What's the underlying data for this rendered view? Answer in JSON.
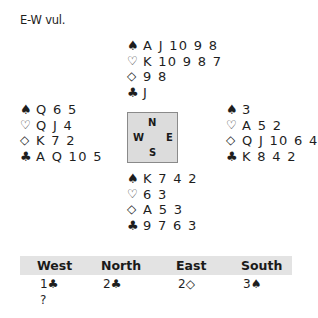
{
  "vulnerability": "E-W vul.",
  "icons": {
    "spade": "♠",
    "heart": "♡",
    "diamond": "◇",
    "club": "♣"
  },
  "hands": {
    "north": {
      "spades": "A J 10 9 8",
      "hearts": "K 10 9 8 7",
      "diamonds": "9 8",
      "clubs": "J"
    },
    "west": {
      "spades": "Q 6 5",
      "hearts": "Q J 4",
      "diamonds": "K 7 2",
      "clubs": "A Q 10 5"
    },
    "east": {
      "spades": "3",
      "hearts": "A 5 2",
      "diamonds": "Q J 10 6 4",
      "clubs": "K 8 4 2"
    },
    "south": {
      "spades": "K 7 4 2",
      "hearts": "6 3",
      "diamonds": "A 5 3",
      "clubs": "9 7 6 3"
    }
  },
  "compass": {
    "n": "N",
    "s": "S",
    "w": "W",
    "e": "E",
    "background": "#dcdcdc"
  },
  "auction": {
    "headers": [
      "West",
      "North",
      "East",
      "South"
    ],
    "header_background": "#e3e3e3",
    "rows": [
      [
        "1♣",
        "2♣",
        "2◇",
        "3♠"
      ],
      [
        "?",
        "",
        "",
        ""
      ]
    ]
  }
}
